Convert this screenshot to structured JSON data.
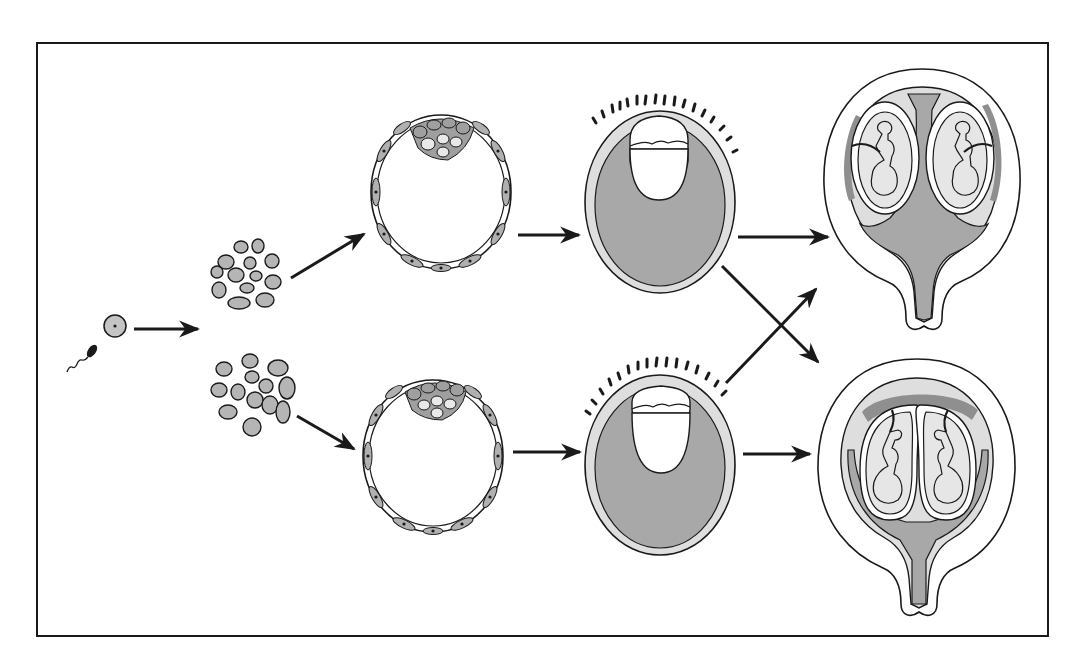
{
  "diagram": {
    "title": "",
    "description_visible_text": [],
    "colors": {
      "background": "#ffffff",
      "stroke": "#1a1a1a",
      "cell_fill": "#b8b8b8",
      "dark_fill": "#a9a9a9",
      "light_fill": "#e2e2e2",
      "placenta_fill": "#8f8f8f"
    },
    "frame": {
      "x": 37,
      "y": 43,
      "width": 1011,
      "height": 593
    },
    "stages": [
      {
        "id": "gametes",
        "label": ""
      },
      {
        "id": "morula-top",
        "label": ""
      },
      {
        "id": "morula-bottom",
        "label": ""
      },
      {
        "id": "blastocyst-top",
        "label": ""
      },
      {
        "id": "blastocyst-bottom",
        "label": ""
      },
      {
        "id": "implanted-embryo-top",
        "label": ""
      },
      {
        "id": "implanted-embryo-bottom",
        "label": ""
      },
      {
        "id": "twin-pregnancy-separate-placentas",
        "label": ""
      },
      {
        "id": "twin-pregnancy-shared-placenta",
        "label": ""
      }
    ],
    "arrows": [
      {
        "from": "gametes",
        "to": "split"
      },
      {
        "from": "morula-top",
        "to": "blastocyst-top"
      },
      {
        "from": "morula-bottom",
        "to": "blastocyst-bottom"
      },
      {
        "from": "blastocyst-top",
        "to": "implanted-embryo-top"
      },
      {
        "from": "blastocyst-bottom",
        "to": "implanted-embryo-bottom"
      },
      {
        "from": "implanted-embryo-top",
        "to": "twin-pregnancy-separate-placentas"
      },
      {
        "from": "implanted-embryo-top",
        "to": "twin-pregnancy-shared-placenta"
      },
      {
        "from": "implanted-embryo-bottom",
        "to": "twin-pregnancy-separate-placentas"
      },
      {
        "from": "implanted-embryo-bottom",
        "to": "twin-pregnancy-shared-placenta"
      }
    ]
  }
}
